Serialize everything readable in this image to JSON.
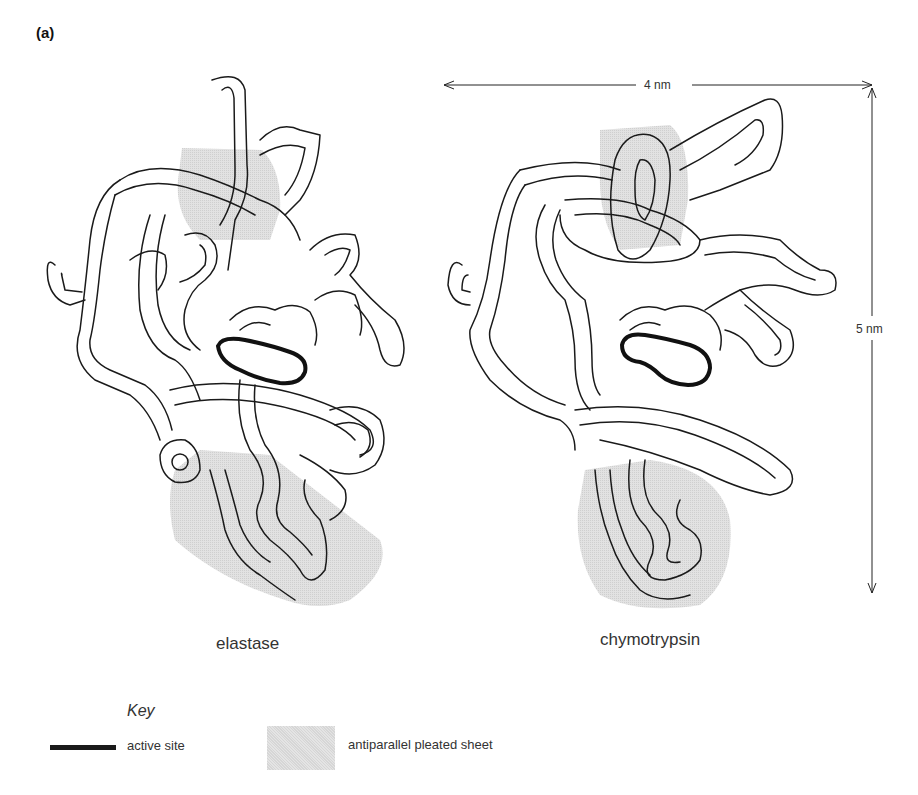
{
  "figure": {
    "panel_label": "(a)",
    "structures": [
      {
        "name": "elastase",
        "caption": "elastase"
      },
      {
        "name": "chymotrypsin",
        "caption": "chymotrypsin"
      }
    ],
    "dimensions": {
      "width_label": "4 nm",
      "height_label": "5 nm"
    }
  },
  "key": {
    "title": "Key",
    "items": [
      {
        "swatch": "thick-black-line",
        "label": "active site",
        "color": "#1a1a1a"
      },
      {
        "swatch": "stippled-gray-area",
        "label": "antiparallel pleated sheet",
        "color": "#dcdcdc"
      }
    ]
  },
  "colors": {
    "outline": "#1a1a1a",
    "sheet_fill": "#dcdcdc",
    "background": "#ffffff"
  }
}
